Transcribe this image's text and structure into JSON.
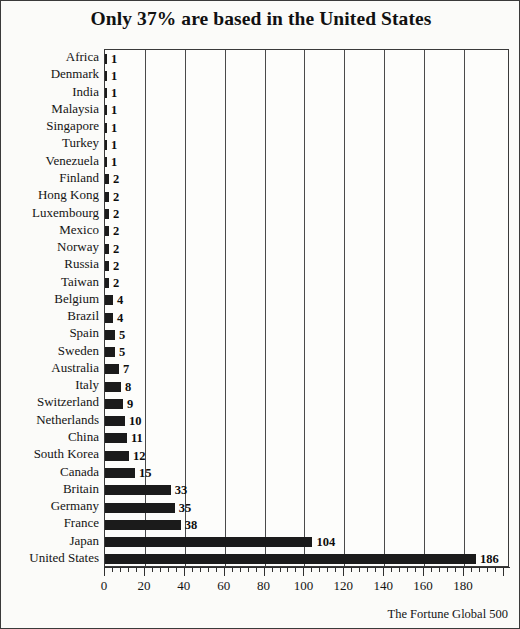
{
  "chart_data": {
    "type": "bar",
    "orientation": "horizontal",
    "title": "Only 37% are based in the United States",
    "source_note": "The Fortune Global 500",
    "xlabel": "",
    "ylabel": "",
    "xlim": [
      0,
      203
    ],
    "grid": "vertical",
    "legend": "none",
    "xticks": [
      0,
      20,
      40,
      60,
      80,
      100,
      120,
      140,
      160,
      180
    ],
    "minor_tick_step": 4,
    "bar_color": "#1b1b1b",
    "grid_color": "#4a4a4a",
    "background_color": "#fbfbf9",
    "border_color": "#3a3a3a",
    "categories": [
      "Africa",
      "Denmark",
      "India",
      "Malaysia",
      "Singapore",
      "Turkey",
      "Venezuela",
      "Finland",
      "Hong Kong",
      "Luxembourg",
      "Mexico",
      "Norway",
      "Russia",
      "Taiwan",
      "Belgium",
      "Brazil",
      "Spain",
      "Sweden",
      "Australia",
      "Italy",
      "Switzerland",
      "Netherlands",
      "China",
      "South Korea",
      "Canada",
      "Britain",
      "Germany",
      "France",
      "Japan",
      "United States"
    ],
    "values": [
      1,
      1,
      1,
      1,
      1,
      1,
      1,
      2,
      2,
      2,
      2,
      2,
      2,
      2,
      4,
      4,
      5,
      5,
      7,
      8,
      9,
      10,
      11,
      12,
      15,
      33,
      35,
      38,
      104,
      186
    ],
    "value_labels": [
      "1",
      "1",
      "1",
      "1",
      "1",
      "1",
      "1",
      "2",
      "2",
      "2",
      "2",
      "2",
      "2",
      "2",
      "4",
      "4",
      "5",
      "5",
      "7",
      "8",
      "9",
      "10",
      "11",
      "12",
      "15",
      "33",
      "35",
      "38",
      "104",
      "186"
    ]
  }
}
